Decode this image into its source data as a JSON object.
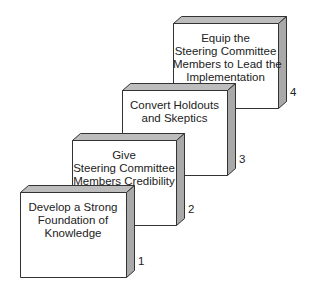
{
  "diagram": {
    "type": "staircase-steps",
    "colors": {
      "front": "#ffffff",
      "side": "#a9a9a9",
      "top": "#bdbdbd",
      "stroke": "#333333",
      "text": "#222222"
    },
    "depth": {
      "dx": 8,
      "dy": 7
    },
    "steps": [
      {
        "number": "1",
        "lines": [
          "Develop a Strong",
          "Foundation of",
          "Knowledge"
        ],
        "x": 20,
        "y": 192,
        "w": 106,
        "h": 85
      },
      {
        "number": "2",
        "lines": [
          "Give",
          "Steering Committee",
          "Members Credibility"
        ],
        "x": 72,
        "y": 140,
        "w": 104,
        "h": 85
      },
      {
        "number": "3",
        "lines": [
          "Convert Holdouts",
          "and Skeptics"
        ],
        "x": 122,
        "y": 90,
        "w": 105,
        "h": 85
      },
      {
        "number": "4",
        "lines": [
          "Equip the",
          "Steering Committee",
          "Members to Lead the",
          "Implementation"
        ],
        "x": 173,
        "y": 23,
        "w": 105,
        "h": 85
      }
    ]
  }
}
